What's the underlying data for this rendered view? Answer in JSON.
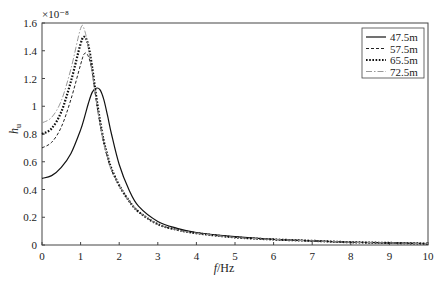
{
  "chart_data": {
    "type": "line",
    "title": "",
    "xlabel": "f/Hz",
    "ylabel": "h_u",
    "y_exponent": "×10⁻⁸",
    "xlim": [
      0,
      10
    ],
    "ylim": [
      0,
      1.6
    ],
    "xticks": [
      "0",
      "1",
      "2",
      "3",
      "4",
      "5",
      "6",
      "7",
      "8",
      "9",
      "10"
    ],
    "yticks": [
      "0",
      "0.2",
      "0.4",
      "0.6",
      "0.8",
      "1",
      "1.2",
      "1.4",
      "1.6"
    ],
    "grid": false,
    "legend_position": "upper right",
    "x": [
      0,
      0.25,
      0.5,
      0.75,
      1.0,
      1.1,
      1.2,
      1.3,
      1.4,
      1.5,
      1.6,
      1.7,
      1.8,
      2.0,
      2.25,
      2.5,
      3.0,
      3.5,
      4.0,
      5.0,
      6.0,
      7.0,
      8.0,
      9.0,
      10.0
    ],
    "series": [
      {
        "name": "47.5m",
        "style": "solid",
        "values": [
          0.48,
          0.5,
          0.56,
          0.66,
          0.83,
          0.92,
          1.02,
          1.1,
          1.13,
          1.12,
          1.05,
          0.93,
          0.8,
          0.58,
          0.4,
          0.28,
          0.17,
          0.12,
          0.09,
          0.06,
          0.04,
          0.03,
          0.02,
          0.015,
          0.01
        ]
      },
      {
        "name": "57.5m",
        "style": "dashed",
        "values": [
          0.7,
          0.74,
          0.85,
          1.05,
          1.3,
          1.38,
          1.36,
          1.25,
          1.05,
          0.88,
          0.74,
          0.63,
          0.54,
          0.43,
          0.32,
          0.24,
          0.15,
          0.11,
          0.085,
          0.055,
          0.04,
          0.03,
          0.02,
          0.015,
          0.01
        ]
      },
      {
        "name": "65.5m",
        "style": "dotted",
        "values": [
          0.8,
          0.84,
          0.96,
          1.18,
          1.45,
          1.5,
          1.44,
          1.28,
          1.08,
          0.9,
          0.75,
          0.64,
          0.55,
          0.43,
          0.32,
          0.24,
          0.15,
          0.11,
          0.085,
          0.055,
          0.04,
          0.03,
          0.02,
          0.015,
          0.01
        ]
      },
      {
        "name": "72.5m",
        "style": "dashdot",
        "values": [
          0.88,
          0.92,
          1.04,
          1.27,
          1.56,
          1.55,
          1.42,
          1.24,
          1.05,
          0.88,
          0.74,
          0.63,
          0.54,
          0.43,
          0.32,
          0.24,
          0.15,
          0.11,
          0.085,
          0.055,
          0.04,
          0.03,
          0.02,
          0.015,
          0.01
        ]
      }
    ]
  },
  "legend": [
    {
      "label": "47.5m"
    },
    {
      "label": "57.5m"
    },
    {
      "label": "65.5m"
    },
    {
      "label": "72.5m"
    }
  ],
  "axis": {
    "xlabel_f": "f",
    "xlabel_unit": "/Hz",
    "ylabel_main": "h",
    "ylabel_sub": "u",
    "exponent": "×10⁻⁸"
  }
}
